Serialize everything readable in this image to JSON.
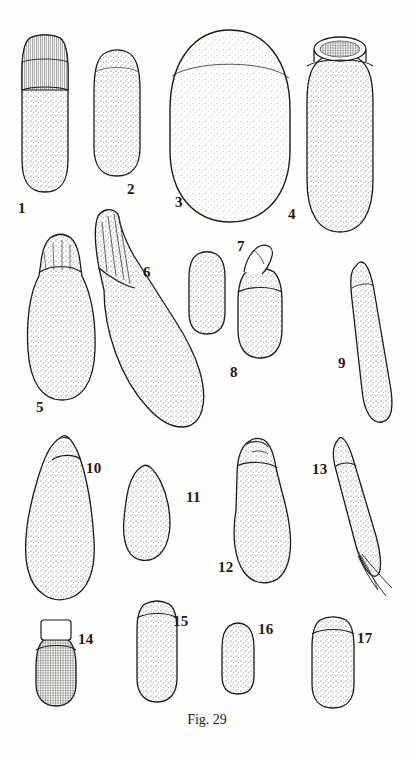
{
  "page": {
    "caption": "Fig. 29",
    "caption_top": 712,
    "background": "#fdfdfb",
    "ink": "#1a1a1a",
    "stipple": "#3a3a38"
  },
  "figure": {
    "title": "Fig. 29",
    "type": "scientific-illustration-plate",
    "count": 17,
    "labels": [
      {
        "n": "1",
        "x": 18,
        "y": 200
      },
      {
        "n": "2",
        "x": 127,
        "y": 181
      },
      {
        "n": "3",
        "x": 175,
        "y": 194
      },
      {
        "n": "4",
        "x": 288,
        "y": 206
      },
      {
        "n": "5",
        "x": 36,
        "y": 399
      },
      {
        "n": "6",
        "x": 143,
        "y": 264
      },
      {
        "n": "7",
        "x": 237,
        "y": 238
      },
      {
        "n": "8",
        "x": 230,
        "y": 364
      },
      {
        "n": "9",
        "x": 338,
        "y": 355
      },
      {
        "n": "10",
        "x": 86,
        "y": 460
      },
      {
        "n": "11",
        "x": 186,
        "y": 489
      },
      {
        "n": "12",
        "x": 218,
        "y": 559
      },
      {
        "n": "13",
        "x": 312,
        "y": 461
      },
      {
        "n": "14",
        "x": 78,
        "y": 631
      },
      {
        "n": "15",
        "x": 173,
        "y": 613
      },
      {
        "n": "16",
        "x": 258,
        "y": 621
      },
      {
        "n": "17",
        "x": 357,
        "y": 630
      }
    ],
    "specimens": [
      {
        "id": "1",
        "name": "specimen-1",
        "description": "elongate club with striated cap"
      },
      {
        "id": "2",
        "name": "specimen-2",
        "description": "small ovoid capsule"
      },
      {
        "id": "3",
        "name": "specimen-3",
        "description": "large broad ovoid"
      },
      {
        "id": "4",
        "name": "specimen-4",
        "description": "elongate ovoid with open circular apex"
      },
      {
        "id": "5",
        "name": "specimen-5",
        "description": "club shape with narrow neck"
      },
      {
        "id": "6",
        "name": "specimen-6",
        "description": "long oblique club with striated neck"
      },
      {
        "id": "7",
        "name": "specimen-7",
        "description": "short rounded cylinder"
      },
      {
        "id": "8",
        "name": "specimen-8",
        "description": "cylinder with folded apex"
      },
      {
        "id": "9",
        "name": "specimen-9",
        "description": "narrow curved cylinder"
      },
      {
        "id": "10",
        "name": "specimen-10",
        "description": "broad pear shape with small cap"
      },
      {
        "id": "11",
        "name": "specimen-11",
        "description": "small pear shape"
      },
      {
        "id": "12",
        "name": "specimen-12",
        "description": "oblique club with notched apex"
      },
      {
        "id": "13",
        "name": "specimen-13",
        "description": "narrow tapering form with bristles"
      },
      {
        "id": "14",
        "name": "specimen-14",
        "description": "short reticulate cylinder with cap"
      },
      {
        "id": "15",
        "name": "specimen-15",
        "description": "narrow cylinder with cap band"
      },
      {
        "id": "16",
        "name": "specimen-16",
        "description": "short stubby cylinder"
      },
      {
        "id": "17",
        "name": "specimen-17",
        "description": "rounded cylinder with cap band"
      }
    ]
  }
}
